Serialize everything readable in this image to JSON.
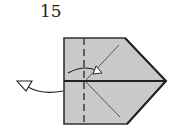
{
  "diagram": {
    "type": "origami-fold-step",
    "step_number": "15",
    "colors": {
      "paper": "#c8c8c8",
      "outline": "#333333",
      "crease": "#555555",
      "background": "#ffffff"
    },
    "elements": [
      {
        "name": "paper-shape",
        "description": "Rectangle with pointed right side (arrow/pentagon shape)"
      },
      {
        "name": "center-fold-line",
        "description": "Horizontal solid line across middle"
      },
      {
        "name": "valley-fold-line",
        "description": "Vertical dashed line near left edge"
      },
      {
        "name": "diagonal-creases",
        "description": "Two diagonal creases meeting at the dashed line"
      },
      {
        "name": "fold-arrow",
        "description": "Curved arrow indicating fold over to the right"
      },
      {
        "name": "turn-over-arrow",
        "description": "Curved arrow with open head pointing left, indicating flip"
      }
    ]
  }
}
